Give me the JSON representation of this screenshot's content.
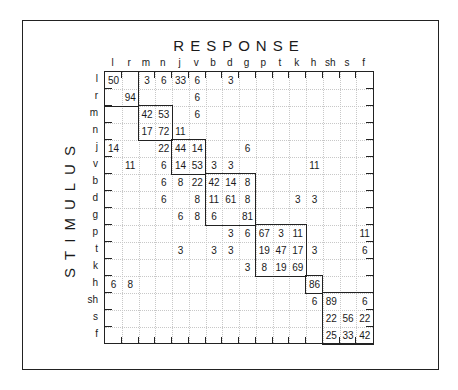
{
  "chart_data": {
    "type": "heatmap",
    "title": "RESPONSE",
    "xlabel": "RESPONSE",
    "ylabel": "STIMULUS",
    "columns": [
      "l",
      "r",
      "m",
      "n",
      "j",
      "v",
      "b",
      "d",
      "g",
      "p",
      "t",
      "k",
      "h",
      "sh",
      "s",
      "f"
    ],
    "rows": [
      "l",
      "r",
      "m",
      "n",
      "j",
      "v",
      "b",
      "d",
      "g",
      "p",
      "t",
      "k",
      "h",
      "sh",
      "s",
      "f"
    ],
    "blocks": [
      {
        "labels": [
          "l",
          "r"
        ],
        "start": 0,
        "size": 2
      },
      {
        "labels": [
          "m",
          "n"
        ],
        "start": 2,
        "size": 2
      },
      {
        "labels": [
          "j",
          "v"
        ],
        "start": 4,
        "size": 2
      },
      {
        "labels": [
          "b",
          "d",
          "g"
        ],
        "start": 6,
        "size": 3
      },
      {
        "labels": [
          "p",
          "t",
          "k"
        ],
        "start": 9,
        "size": 3
      },
      {
        "labels": [
          "h"
        ],
        "start": 12,
        "size": 1
      },
      {
        "labels": [
          "sh",
          "s",
          "f"
        ],
        "start": 13,
        "size": 3
      }
    ],
    "values": [
      [
        50,
        null,
        3,
        6,
        33,
        6,
        null,
        3,
        null,
        null,
        null,
        null,
        null,
        null,
        null,
        null
      ],
      [
        null,
        94,
        null,
        null,
        null,
        6,
        null,
        null,
        null,
        null,
        null,
        null,
        null,
        null,
        null,
        null
      ],
      [
        null,
        null,
        42,
        53,
        null,
        6,
        null,
        null,
        null,
        null,
        null,
        null,
        null,
        null,
        null,
        null
      ],
      [
        null,
        null,
        17,
        72,
        11,
        null,
        null,
        null,
        null,
        null,
        null,
        null,
        null,
        null,
        null,
        null
      ],
      [
        14,
        null,
        null,
        22,
        44,
        14,
        null,
        null,
        6,
        null,
        null,
        null,
        null,
        null,
        null,
        null
      ],
      [
        null,
        11,
        null,
        6,
        14,
        53,
        3,
        3,
        null,
        null,
        null,
        null,
        11,
        null,
        null,
        null
      ],
      [
        null,
        null,
        null,
        6,
        8,
        22,
        42,
        14,
        8,
        null,
        null,
        null,
        null,
        null,
        null,
        null
      ],
      [
        null,
        null,
        null,
        6,
        null,
        8,
        11,
        61,
        8,
        null,
        null,
        3,
        3,
        null,
        null,
        null
      ],
      [
        null,
        null,
        null,
        null,
        6,
        8,
        6,
        null,
        81,
        null,
        null,
        null,
        null,
        null,
        null,
        null
      ],
      [
        null,
        null,
        null,
        null,
        null,
        null,
        null,
        3,
        6,
        67,
        3,
        11,
        null,
        null,
        null,
        11
      ],
      [
        null,
        null,
        null,
        null,
        3,
        null,
        3,
        3,
        null,
        19,
        47,
        17,
        3,
        null,
        null,
        6
      ],
      [
        null,
        null,
        null,
        null,
        null,
        null,
        null,
        null,
        3,
        8,
        19,
        69,
        null,
        null,
        null,
        null
      ],
      [
        6,
        8,
        null,
        null,
        null,
        null,
        null,
        null,
        null,
        null,
        null,
        null,
        86,
        null,
        null,
        null
      ],
      [
        null,
        null,
        null,
        null,
        null,
        null,
        null,
        null,
        null,
        null,
        null,
        null,
        6,
        89,
        null,
        6
      ],
      [
        null,
        null,
        null,
        null,
        null,
        null,
        null,
        null,
        null,
        null,
        null,
        null,
        null,
        22,
        56,
        22
      ],
      [
        null,
        null,
        null,
        null,
        null,
        null,
        null,
        null,
        null,
        null,
        null,
        null,
        null,
        25,
        33,
        42
      ]
    ],
    "grid": true
  },
  "labels": {
    "title": "RESPONSE",
    "ylabel": "STIMULUS"
  }
}
